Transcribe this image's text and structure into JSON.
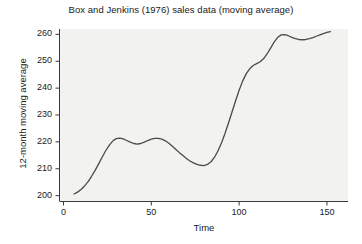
{
  "chart_data": {
    "type": "line",
    "title": "Box and Jenkins (1976) sales data (moving average)",
    "xlabel": "Time",
    "ylabel": "12-month moving average",
    "xlim": [
      -2,
      162
    ],
    "ylim": [
      198.0,
      262.0
    ],
    "xticks": [
      0,
      50,
      100,
      150
    ],
    "xtick_labels": [
      "0",
      "50",
      "100",
      "150"
    ],
    "yticks": [
      200,
      210,
      220,
      230,
      240,
      250,
      260
    ],
    "ytick_labels": [
      "200",
      "210",
      "220",
      "230",
      "240",
      "250",
      "260"
    ],
    "grid": false,
    "legend": false,
    "legend_position": "none",
    "line_color": "#4a4a4a",
    "panel_color": "#f2f2f0",
    "series": [
      {
        "name": "12-month moving average",
        "x": [
          6,
          8,
          10,
          12,
          14,
          16,
          18,
          20,
          22,
          24,
          26,
          28,
          30,
          32,
          34,
          36,
          38,
          40,
          42,
          44,
          46,
          48,
          50,
          52,
          54,
          56,
          58,
          60,
          62,
          64,
          66,
          68,
          70,
          72,
          74,
          76,
          78,
          80,
          82,
          84,
          86,
          88,
          90,
          92,
          94,
          96,
          98,
          100,
          102,
          104,
          106,
          108,
          110,
          112,
          114,
          116,
          118,
          120,
          122,
          124,
          126,
          128,
          130,
          132,
          134,
          136,
          138,
          140,
          142,
          144,
          146,
          148,
          150,
          152
        ],
        "y": [
          200.6,
          201.3,
          202.3,
          203.6,
          205.2,
          207.2,
          209.4,
          211.8,
          214.3,
          216.7,
          218.7,
          220.3,
          221.2,
          221.4,
          221.1,
          220.5,
          219.9,
          219.4,
          219.2,
          219.4,
          219.9,
          220.5,
          221.0,
          221.3,
          221.3,
          221.0,
          220.4,
          219.5,
          218.4,
          217.2,
          216.0,
          214.9,
          213.8,
          212.9,
          212.2,
          211.6,
          211.3,
          211.2,
          211.6,
          212.6,
          214.3,
          216.7,
          219.7,
          223.2,
          227.1,
          231.2,
          235.3,
          239.2,
          242.6,
          245.3,
          247.2,
          248.4,
          249.1,
          249.8,
          251.0,
          252.8,
          255.0,
          257.2,
          258.9,
          259.8,
          259.9,
          259.5,
          258.9,
          258.4,
          258.1,
          258.0,
          258.1,
          258.4,
          258.8,
          259.3,
          259.8,
          260.3,
          260.7,
          261.0
        ]
      }
    ]
  }
}
